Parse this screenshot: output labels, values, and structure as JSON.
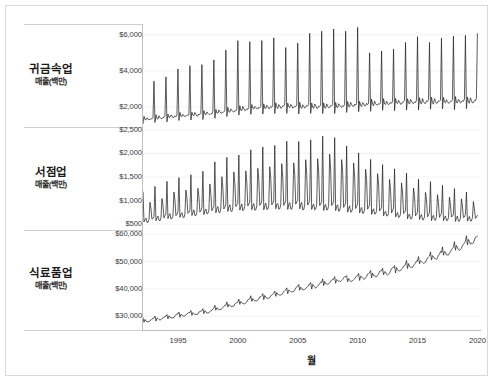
{
  "chart_data": {
    "type": "line",
    "title": "",
    "subtitle": "",
    "xlabel": "월",
    "ylabel": "",
    "grid": true,
    "legend_position": "none",
    "x": {
      "label": "월",
      "tick_labels": [
        "1995",
        "2000",
        "2005",
        "2010",
        "2015",
        "2020"
      ],
      "tick_values": [
        1995,
        2000,
        2005,
        2010,
        2015,
        2020
      ],
      "range": [
        1992.0,
        2020.3
      ],
      "unit": "year"
    },
    "panels": [
      {
        "id": "jewelry",
        "row_label": "귀금속업",
        "row_sublabel": "매출(백만)",
        "ylim": [
          900,
          6600
        ],
        "tick_labels": [
          "$2,000",
          "$4,000",
          "$6,000"
        ],
        "tick_values": [
          2000,
          4000,
          6000
        ],
        "series_name": "귀금속업 매출(백만)",
        "description": "Monthly jewelry store sales with strong December seasonal peaks; baseline rises from ~1400 to ~2300, peaks grow from ~3400 to ~6300 then plateau.",
        "baseline": [
          1320,
          1400,
          1460,
          1510,
          1560,
          1620,
          1700,
          1790,
          1870,
          1930,
          1980,
          2010,
          2020,
          2010,
          2000,
          2010,
          2040,
          2080,
          2120,
          2160,
          2200,
          2230,
          2250,
          2260,
          2270,
          2280,
          2300,
          2310
        ],
        "peaks": [
          3400,
          3700,
          4100,
          4350,
          4400,
          4600,
          5100,
          5750,
          5650,
          5600,
          5750,
          5300,
          5600,
          6050,
          6200,
          6350,
          6200,
          6350,
          5000,
          5100,
          5250,
          5600,
          6000,
          5650,
          5800,
          5850,
          5900,
          6000
        ],
        "dip_ratio": 0.82,
        "minor_wave": 0.07
      },
      {
        "id": "bookstores",
        "row_label": "서점업",
        "row_sublabel": "매출(백만)",
        "ylim": [
          380,
          2560
        ],
        "tick_labels": [
          "$500",
          "$1,000",
          "$1,500",
          "$2,000",
          "$2,500"
        ],
        "tick_values": [
          500,
          1000,
          1500,
          2000,
          2500
        ],
        "series_name": "서점업 매출(백만)",
        "description": "Monthly bookstore sales with twice-yearly (January and September) school-term peaks; rises to a maximum near 2007-2008 then declines steadily through 2020.",
        "baseline": [
          640,
          680,
          720,
          760,
          800,
          840,
          880,
          910,
          935,
          950,
          960,
          965,
          965,
          960,
          950,
          940,
          920,
          895,
          865,
          830,
          795,
          760,
          730,
          705,
          690,
          680,
          670,
          665
        ],
        "peaks": [
          1180,
          1290,
          1420,
          1500,
          1540,
          1650,
          1820,
          1930,
          1960,
          2050,
          2120,
          2170,
          2230,
          2250,
          2280,
          2400,
          2320,
          2180,
          2040,
          1900,
          1760,
          1670,
          1560,
          1450,
          1380,
          1320,
          1260,
          1180
        ],
        "trough_ratio": 0.74,
        "minor_wave": 0.1
      },
      {
        "id": "grocery",
        "row_label": "식료품업",
        "row_sublabel": "매출(백만)",
        "ylim": [
          25000,
          61500
        ],
        "tick_labels": [
          "$30,000",
          "$40,000",
          "$50,000",
          "$60,000"
        ],
        "tick_values": [
          30000,
          40000,
          50000,
          60000
        ],
        "series_name": "식료품업 매출(백만)",
        "description": "Monthly grocery store sales rising steadily and nearly linearly from about $28,000M in 1992 to about $58,000M in 2020, with small regular seasonal ripples.",
        "baseline": [
          28000,
          28700,
          29300,
          30000,
          30600,
          31200,
          32300,
          33500,
          34600,
          35600,
          36500,
          37600,
          38700,
          39600,
          40500,
          41600,
          42600,
          42800,
          43600,
          44500,
          45300,
          46400,
          47800,
          49300,
          50800,
          52400,
          54200,
          56400
        ],
        "peaks": [
          29400,
          30100,
          30800,
          31500,
          32100,
          32800,
          34000,
          35300,
          36400,
          37400,
          38300,
          39500,
          40700,
          41600,
          42500,
          43700,
          44700,
          45000,
          45800,
          46800,
          47700,
          48800,
          50300,
          51900,
          53600,
          55300,
          57200,
          59400
        ],
        "trough_ratio": 0.955,
        "minor_wave": 0.022
      }
    ]
  },
  "axis": {
    "x_title": "월"
  }
}
